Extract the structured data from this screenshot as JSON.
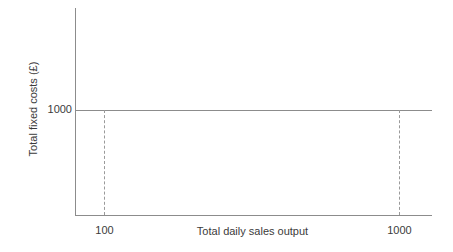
{
  "chart_data": {
    "type": "line",
    "title": "",
    "xlabel": "Total daily sales output",
    "ylabel": "Total fixed costs (£)",
    "series": [
      {
        "name": "Total fixed costs",
        "x": [
          0,
          100,
          1000,
          1215
        ],
        "values": [
          1000,
          1000,
          1000,
          1000
        ]
      }
    ],
    "x_ticks": [
      "100",
      "1000"
    ],
    "x_tick_values": [
      100,
      1000
    ],
    "y_ticks": [
      "1000"
    ],
    "y_tick_values": [
      1000
    ],
    "xlim": [
      0,
      1215
    ],
    "ylim": [
      0,
      2040
    ],
    "grid": false,
    "legend": "none",
    "annotations": [
      {
        "kind": "dropline",
        "style": "dashed",
        "x_value": 100,
        "from_y": 1000,
        "to_y": 0
      },
      {
        "kind": "dropline",
        "style": "dashed",
        "x_value": 1000,
        "from_y": 1000,
        "to_y": 0
      }
    ],
    "colors": {
      "background": "#ffffff",
      "axis": "#8c8c8c",
      "series_line": "#8c8c8c",
      "dropline": "#9a9a9a",
      "text": "#3b3b3b"
    }
  },
  "axes": {
    "y_title": "Total fixed costs (£)",
    "x_title": "Total daily sales output",
    "y_tick_1000": "1000",
    "x_tick_100": "100",
    "x_tick_1000": "1000"
  }
}
